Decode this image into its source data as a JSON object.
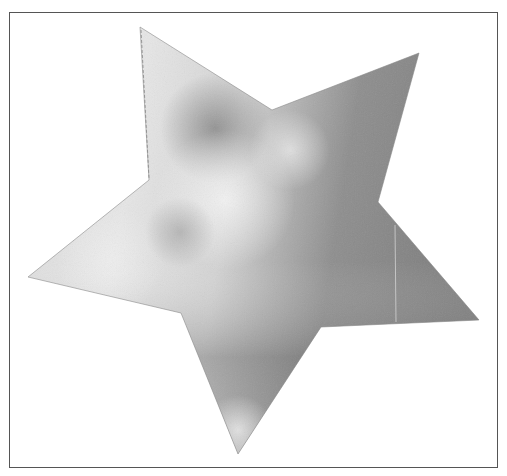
{
  "figure": {
    "shape": "star",
    "frame": {
      "x": 9,
      "y": 12,
      "width": 489,
      "height": 456,
      "stroke": "#555555"
    },
    "star": {
      "points": "140,27 272,110 419,53 378,202 479,320 321,327 238,454 181,313 28,277 149,180",
      "fill_style": "grayscale metallic gradient",
      "colors": {
        "light": "#f0f0f0",
        "mid": "#c4c4c4",
        "dark": "#7a7a7a",
        "darker": "#6a6a6a"
      }
    }
  }
}
